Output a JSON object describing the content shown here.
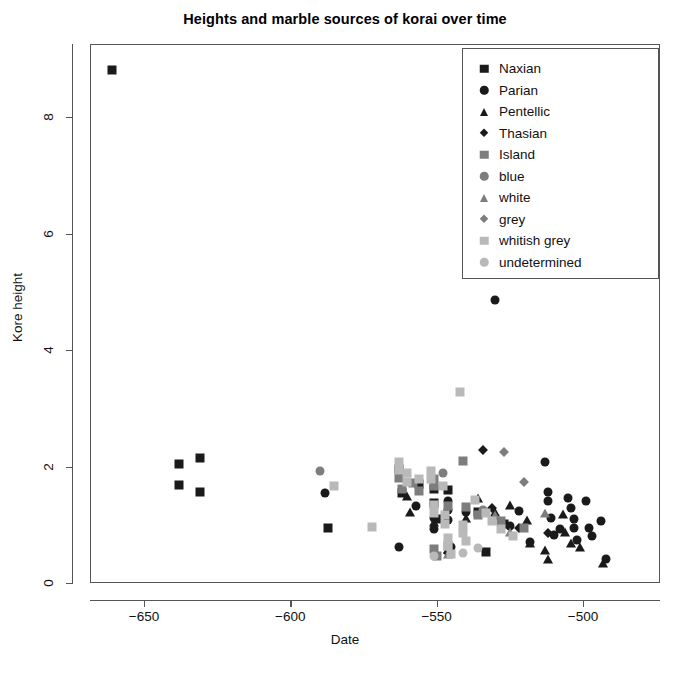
{
  "chart_data": {
    "type": "scatter",
    "title": "Heights and marble sources of korai over time",
    "xlabel": "Date",
    "ylabel": "Kore height",
    "xlim": [
      -672,
      -490
    ],
    "ylim": [
      -0.25,
      9.35
    ],
    "xticks": [
      -650,
      -600,
      -550,
      -500
    ],
    "xticklabels": [
      "−650",
      "−600",
      "−550",
      "−500"
    ],
    "yticks": [
      0,
      2,
      4,
      6,
      8
    ],
    "yticklabels": [
      "0",
      "2",
      "4",
      "6",
      "8"
    ],
    "grid": false,
    "legend_position": "top-right",
    "legend": [
      {
        "label": "Naxian",
        "shape": "square",
        "color": "#1a1a1a"
      },
      {
        "label": "Parian",
        "shape": "circle",
        "color": "#1a1a1a"
      },
      {
        "label": "Pentellic",
        "shape": "triangle",
        "color": "#1a1a1a"
      },
      {
        "label": "Thasian",
        "shape": "diamond",
        "color": "#1a1a1a"
      },
      {
        "label": "Island",
        "shape": "square",
        "color": "#7d7d7d"
      },
      {
        "label": "blue",
        "shape": "circle",
        "color": "#7d7d7d"
      },
      {
        "label": "white",
        "shape": "triangle",
        "color": "#7d7d7d"
      },
      {
        "label": "grey",
        "shape": "diamond",
        "color": "#7d7d7d"
      },
      {
        "label": "whitish grey",
        "shape": "square",
        "color": "#b9b9b9"
      },
      {
        "label": "undetermined",
        "shape": "circle",
        "color": "#b9b9b9"
      }
    ],
    "series": [
      {
        "name": "Naxian",
        "shape": "square",
        "color": "#1a1a1a",
        "points": [
          [
            -661,
            8.8
          ],
          [
            -638,
            2.05
          ],
          [
            -638,
            1.68
          ],
          [
            -631,
            2.15
          ],
          [
            -631,
            1.57
          ],
          [
            -587,
            0.95
          ],
          [
            -563,
            1.95
          ],
          [
            -562,
            1.55
          ],
          [
            -556,
            1.7
          ],
          [
            -551,
            1.62
          ],
          [
            -551,
            1.38
          ],
          [
            -550,
            1.1
          ],
          [
            -546,
            1.6
          ],
          [
            -536,
            1.22
          ],
          [
            -533,
            0.54
          ],
          [
            -527,
            1.02
          ]
        ]
      },
      {
        "name": "Parian",
        "shape": "circle",
        "color": "#1a1a1a",
        "points": [
          [
            -588,
            1.55
          ],
          [
            -563,
            0.62
          ],
          [
            -557,
            1.32
          ],
          [
            -551,
            1.12
          ],
          [
            -551,
            0.92
          ],
          [
            -546,
            1.4
          ],
          [
            -546,
            1.26
          ],
          [
            -546,
            1.08
          ],
          [
            -545,
            0.62
          ],
          [
            -540,
            1.22
          ],
          [
            -530,
            4.85
          ],
          [
            -525,
            0.98
          ],
          [
            -522,
            1.24
          ],
          [
            -518,
            0.7
          ],
          [
            -513,
            2.08
          ],
          [
            -512,
            1.56
          ],
          [
            -512,
            1.4
          ],
          [
            -511,
            1.12
          ],
          [
            -510,
            0.82
          ],
          [
            -508,
            0.92
          ],
          [
            -505,
            1.46
          ],
          [
            -504,
            1.28
          ],
          [
            -503,
            1.1
          ],
          [
            -503,
            0.95
          ],
          [
            -502,
            0.74
          ],
          [
            -499,
            1.4
          ],
          [
            -498,
            0.95
          ],
          [
            -497,
            0.8
          ],
          [
            -494,
            1.06
          ],
          [
            -492,
            0.42
          ]
        ]
      },
      {
        "name": "Pentellic",
        "shape": "triangle",
        "color": "#1a1a1a",
        "points": [
          [
            -560,
            1.5
          ],
          [
            -559,
            1.22
          ],
          [
            -551,
            1.05
          ],
          [
            -546,
            0.58
          ],
          [
            -540,
            1.12
          ],
          [
            -536,
            1.46
          ],
          [
            -530,
            1.22
          ],
          [
            -525,
            1.34
          ],
          [
            -519,
            1.08
          ],
          [
            -518,
            0.68
          ],
          [
            -513,
            0.56
          ],
          [
            -512,
            0.42
          ],
          [
            -507,
            1.18
          ],
          [
            -506,
            0.88
          ],
          [
            -504,
            0.68
          ],
          [
            -501,
            0.62
          ],
          [
            -493,
            0.34
          ]
        ]
      },
      {
        "name": "Thasian",
        "shape": "diamond",
        "color": "#1a1a1a",
        "points": [
          [
            -546,
            0.52
          ],
          [
            -534,
            2.28
          ],
          [
            -531,
            1.28
          ],
          [
            -522,
            0.95
          ],
          [
            -512,
            0.86
          ]
        ]
      },
      {
        "name": "Island",
        "shape": "square",
        "color": "#7d7d7d",
        "points": [
          [
            -563,
            1.8
          ],
          [
            -562,
            1.62
          ],
          [
            -558,
            1.72
          ],
          [
            -556,
            1.58
          ],
          [
            -551,
            1.78
          ],
          [
            -551,
            1.66
          ],
          [
            -551,
            0.58
          ],
          [
            -550,
            0.46
          ],
          [
            -546,
            1.32
          ],
          [
            -546,
            0.64
          ],
          [
            -541,
            2.1
          ],
          [
            -540,
            1.3
          ],
          [
            -536,
            1.16
          ],
          [
            -528,
            1.06
          ],
          [
            -520,
            0.94
          ]
        ]
      },
      {
        "name": "blue",
        "shape": "circle",
        "color": "#7d7d7d",
        "points": [
          [
            -590,
            1.92
          ],
          [
            -548,
            1.88
          ],
          [
            -534,
            1.26
          ]
        ]
      },
      {
        "name": "white",
        "shape": "triangle",
        "color": "#7d7d7d",
        "points": [
          [
            -546,
            0.5
          ],
          [
            -530,
            1.16
          ],
          [
            -525,
            0.88
          ],
          [
            -513,
            1.2
          ]
        ]
      },
      {
        "name": "grey",
        "shape": "diamond",
        "color": "#7d7d7d",
        "points": [
          [
            -527,
            2.25
          ],
          [
            -520,
            1.74
          ]
        ]
      },
      {
        "name": "whitish grey",
        "shape": "square",
        "color": "#b9b9b9",
        "points": [
          [
            -585,
            1.66
          ],
          [
            -572,
            0.96
          ],
          [
            -563,
            2.08
          ],
          [
            -563,
            1.94
          ],
          [
            -560,
            1.88
          ],
          [
            -560,
            1.74
          ],
          [
            -556,
            1.78
          ],
          [
            -552,
            1.92
          ],
          [
            -552,
            1.78
          ],
          [
            -551,
            1.34
          ],
          [
            -551,
            1.2
          ],
          [
            -548,
            1.66
          ],
          [
            -547,
            1.16
          ],
          [
            -547,
            1.02
          ],
          [
            -546,
            0.78
          ],
          [
            -546,
            0.64
          ],
          [
            -545,
            0.5
          ],
          [
            -542,
            3.28
          ],
          [
            -541,
            1.0
          ],
          [
            -541,
            0.86
          ],
          [
            -540,
            0.72
          ],
          [
            -537,
            1.42
          ],
          [
            -533,
            1.2
          ],
          [
            -531,
            1.06
          ],
          [
            -528,
            0.92
          ],
          [
            -524,
            0.8
          ]
        ]
      },
      {
        "name": "undetermined",
        "shape": "circle",
        "color": "#b9b9b9",
        "points": [
          [
            -551,
            0.46
          ],
          [
            -541,
            0.52
          ],
          [
            -536,
            0.6
          ]
        ]
      }
    ]
  }
}
